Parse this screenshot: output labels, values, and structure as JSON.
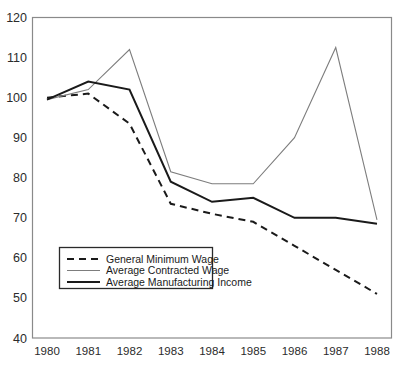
{
  "chart_data": {
    "type": "line",
    "title": "",
    "subtitle": "",
    "xlabel": "",
    "ylabel": "",
    "categories": [
      "1980",
      "1981",
      "1982",
      "1983",
      "1984",
      "1985",
      "1986",
      "1987",
      "1988"
    ],
    "x": [
      1980,
      1981,
      1982,
      1983,
      1984,
      1985,
      1986,
      1987,
      1988
    ],
    "xlim": [
      1980,
      1988
    ],
    "ylim": [
      40,
      120
    ],
    "yticks": [
      40,
      50,
      60,
      70,
      80,
      90,
      100,
      110,
      120
    ],
    "ytick_labels": [
      "40",
      "50",
      "60",
      "70",
      "80",
      "90",
      "100",
      "110",
      "120"
    ],
    "grid": false,
    "legend_position": "lower-left-inside",
    "series": [
      {
        "name": "General Minimum Wage",
        "style": "dashed",
        "color": "#1a1a1a",
        "width": 2.0,
        "values": [
          100,
          101,
          93.5,
          73.5,
          71,
          69,
          63,
          57,
          51
        ]
      },
      {
        "name": "Average Contracted Wage",
        "style": "solid",
        "color": "#7d7d7d",
        "width": 1.1,
        "values": [
          99.5,
          102,
          112,
          81.5,
          78.5,
          78.5,
          90,
          112.5,
          69.5
        ]
      },
      {
        "name": "Average Manufacturing Income",
        "style": "solid",
        "color": "#1a1a1a",
        "width": 2.0,
        "values": [
          99.5,
          104,
          102,
          79,
          74,
          75,
          70,
          70,
          68.5
        ]
      }
    ]
  },
  "legend": {
    "entries": [
      {
        "label": "General Minimum Wage"
      },
      {
        "label": "Average Contracted Wage"
      },
      {
        "label": "Average Manufacturing Income"
      }
    ]
  },
  "axes": {
    "y_tick_labels": [
      "120",
      "110",
      "100",
      "90",
      "80",
      "70",
      "60",
      "50",
      "40"
    ],
    "x_tick_labels": [
      "1980",
      "1981",
      "1982",
      "1983",
      "1984",
      "1985",
      "1986",
      "1987",
      "1988"
    ]
  },
  "colors": {
    "frame": "#8a8a8a",
    "dark_line": "#1a1a1a",
    "gray_line": "#7d7d7d",
    "text": "#2b2b2b",
    "background": "#ffffff"
  }
}
